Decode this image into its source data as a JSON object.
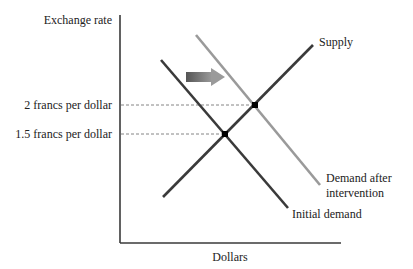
{
  "diagram": {
    "type": "supply-demand",
    "y_axis_label": "Exchange rate",
    "x_axis_label": "Dollars",
    "price_levels": [
      {
        "label": "2 francs per dollar",
        "value": 2.0
      },
      {
        "label": "1.5 francs per dollar",
        "value": 1.5
      }
    ],
    "curves": {
      "supply": {
        "label": "Supply",
        "color": "#3a3a3a"
      },
      "initial_demand": {
        "label": "Initial demand",
        "color": "#3a3a3a"
      },
      "demand_after": {
        "label_line1": "Demand after",
        "label_line2": "intervention",
        "color": "#9a9a9a"
      }
    },
    "equilibria": [
      {
        "name": "initial",
        "price": 1.5
      },
      {
        "name": "after-intervention",
        "price": 2.0
      }
    ],
    "shift_arrow": {
      "direction": "right",
      "meaning": "demand shift"
    }
  }
}
